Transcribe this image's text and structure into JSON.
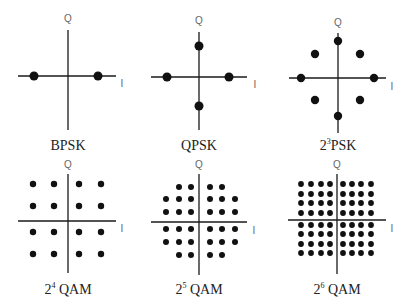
{
  "chart_data": [
    {
      "type": "scatter",
      "title": "BPSK",
      "caption": {
        "base": "",
        "sup": "",
        "text": "BPSK"
      },
      "xlabel": "I",
      "ylabel": "Q",
      "origin": [
        68,
        76
      ],
      "xaxis": [
        18,
        116
      ],
      "yaxis": [
        30,
        130
      ],
      "label_pos": {
        "q": [
          68,
          22
        ],
        "i": [
          122,
          87
        ],
        "cap": [
          68,
          150
        ]
      },
      "dot_r": 4.5,
      "points": [
        [
          34,
          76
        ],
        [
          98,
          76
        ]
      ]
    },
    {
      "type": "scatter",
      "title": "QPSK",
      "caption": {
        "base": "",
        "sup": "",
        "text": "QPSK"
      },
      "xlabel": "I",
      "ylabel": "Q",
      "origin": [
        199,
        77
      ],
      "xaxis": [
        151,
        247
      ],
      "yaxis": [
        32,
        130
      ],
      "label_pos": {
        "q": [
          199,
          24
        ],
        "i": [
          255,
          88
        ],
        "cap": [
          199,
          150
        ]
      },
      "dot_r": 4.5,
      "points": [
        [
          167,
          77
        ],
        [
          229,
          77
        ],
        [
          199,
          46
        ],
        [
          199,
          106
        ]
      ]
    },
    {
      "type": "scatter",
      "title": "2³PSK",
      "caption": {
        "base": "2",
        "sup": "3",
        "text": "PSK"
      },
      "xlabel": "I",
      "ylabel": "Q",
      "origin": [
        338,
        78
      ],
      "xaxis": [
        289,
        386
      ],
      "yaxis": [
        33,
        133
      ],
      "label_pos": {
        "q": [
          338,
          26
        ],
        "i": [
          392,
          90
        ],
        "cap": [
          338,
          150
        ]
      },
      "dot_r": 4.2,
      "points": [
        [
          338,
          41
        ],
        [
          338,
          116
        ],
        [
          301,
          78
        ],
        [
          374,
          78
        ],
        [
          315,
          54
        ],
        [
          360,
          54
        ],
        [
          315,
          100
        ],
        [
          360,
          100
        ]
      ]
    },
    {
      "type": "scatter",
      "title": "2⁴ QAM",
      "caption": {
        "base": "2",
        "sup": "4",
        "text": " QAM"
      },
      "xlabel": "I",
      "ylabel": "Q",
      "origin": [
        68,
        221
      ],
      "xaxis": [
        18,
        116
      ],
      "yaxis": [
        174,
        273
      ],
      "label_pos": {
        "q": [
          68,
          168
        ],
        "i": [
          122,
          232
        ],
        "cap": [
          68,
          294
        ]
      },
      "dot_r": 3.2,
      "grid": {
        "xs": [
          33,
          54,
          79,
          101
        ],
        "ys": [
          184,
          206,
          232,
          254
        ]
      }
    },
    {
      "type": "scatter",
      "title": "2⁵ QAM",
      "caption": {
        "base": "2",
        "sup": "5",
        "text": " QAM"
      },
      "xlabel": "I",
      "ylabel": "Q",
      "origin": [
        199,
        222
      ],
      "xaxis": [
        151,
        247
      ],
      "yaxis": [
        174,
        275
      ],
      "label_pos": {
        "q": [
          199,
          168
        ],
        "i": [
          254,
          234
        ],
        "cap": [
          199,
          294
        ]
      },
      "dot_r": 3.0,
      "grid": {
        "xs": [
          166,
          179,
          191,
          210,
          222,
          235
        ],
        "ys": [
          187,
          199,
          212,
          229,
          242,
          255
        ]
      },
      "omit_corners": true
    },
    {
      "type": "scatter",
      "title": "2⁶ QAM",
      "caption": {
        "base": "2",
        "sup": "6",
        "text": " QAM"
      },
      "xlabel": "I",
      "ylabel": "Q",
      "origin": [
        337,
        220
      ],
      "xaxis": [
        288,
        386
      ],
      "yaxis": [
        174,
        274
      ],
      "label_pos": {
        "q": [
          337,
          168
        ],
        "i": [
          392,
          232
        ],
        "cap": [
          337,
          294
        ]
      },
      "dot_r": 2.9,
      "grid": {
        "xs": [
          301,
          311,
          321,
          330,
          343,
          352,
          361,
          371
        ],
        "ys": [
          184,
          194,
          203,
          213,
          225,
          234,
          244,
          253
        ]
      }
    }
  ]
}
